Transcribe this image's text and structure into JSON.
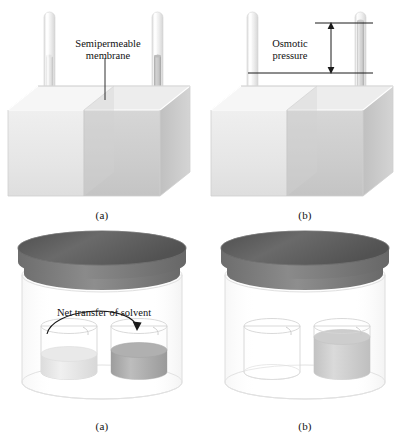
{
  "figure": {
    "panels": [
      {
        "id": "a-top",
        "caption": "(a)",
        "description": "Two-compartment cell with semipermeable membrane, equal liquid levels"
      },
      {
        "id": "b-top",
        "caption": "(b)",
        "description": "Two-compartment cell after osmosis, right tube level raised"
      },
      {
        "id": "a-bot",
        "caption": "(a)",
        "description": "Sealed jar with two open beakers, equal levels, net transfer of solvent begins"
      },
      {
        "id": "b-bot",
        "caption": "(b)",
        "description": "Sealed jar after transfer, left beaker empty and right beaker full"
      }
    ]
  },
  "labels": {
    "semipermeable_membrane": "Semipermeable\nmembrane",
    "osmotic_pressure": "Osmotic\npressure",
    "net_transfer": "Net transfer of solvent"
  },
  "colors": {
    "solvent_light": "#ececec",
    "solution_dark": "#b9b9b9",
    "box_left_face": "#e8e8e8",
    "box_right_face": "#cfcfcf",
    "box_top_face": "#f4f4f4",
    "lid_top": "#5e5e5e",
    "lid_side": "#777777",
    "glass_outline": "#d8d8d8",
    "annotation_line": "#1a1a1a",
    "text": "#111111",
    "background": "#ffffff"
  }
}
